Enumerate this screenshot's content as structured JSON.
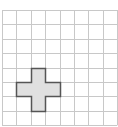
{
  "diagram": {
    "type": "grid-with-shape",
    "grid": {
      "columns": 8,
      "rows": 8,
      "origin_x": 2,
      "origin_y": 10,
      "cell_size": 14.4,
      "line_color": "#c8c8c8"
    },
    "shape": {
      "name": "plus-cross",
      "fill_color": "#e0e0e0",
      "stroke_color": "#555555",
      "cells": [
        [
          2,
          4
        ],
        [
          1,
          5
        ],
        [
          2,
          5
        ],
        [
          3,
          5
        ],
        [
          2,
          6
        ]
      ]
    }
  }
}
